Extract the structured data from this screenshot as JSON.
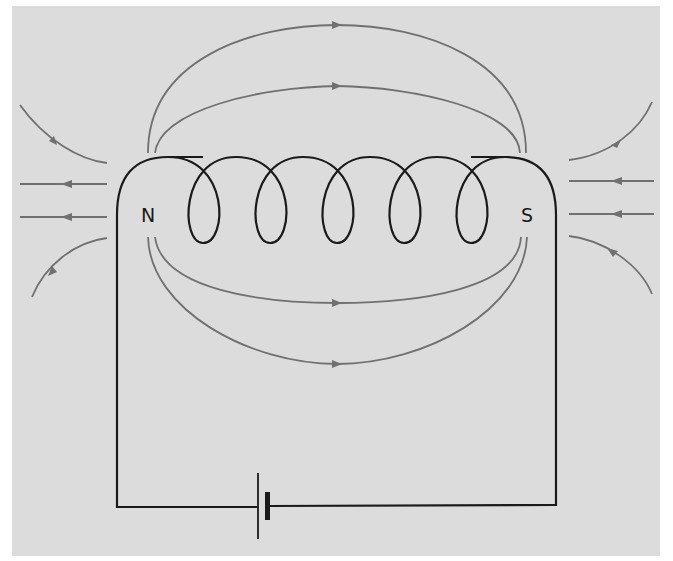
{
  "figure": {
    "type": "electromagnet_solenoid_field_diagram",
    "background_color": "#dcdcdc",
    "wire_color": "#1a1a1a",
    "field_line_color": "#707070",
    "poles": {
      "north": {
        "label": "N"
      },
      "south": {
        "label": "S"
      }
    },
    "coil": {
      "turns": 5
    },
    "battery": {
      "symbol": "cell"
    },
    "field_lines": {
      "top_arcs": 2,
      "bottom_arcs": 2,
      "left_external": 4,
      "right_external": 4,
      "direction": "out of N, into S"
    }
  }
}
